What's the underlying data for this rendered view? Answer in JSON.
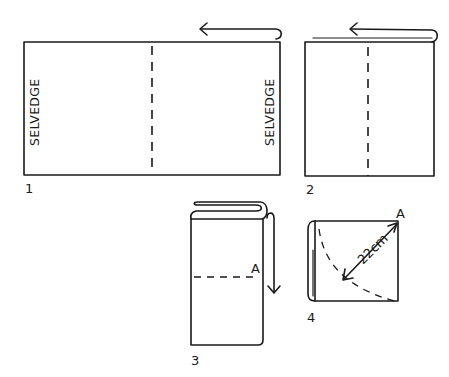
{
  "figure": {
    "type": "fabric folding instructions",
    "steps": [
      {
        "number": "1",
        "left_edge_label": "SELVEDGE",
        "right_edge_label": "SELVEDGE"
      },
      {
        "number": "2"
      },
      {
        "number": "3",
        "point_label": "A"
      },
      {
        "number": "4",
        "point_label": "A",
        "measurement": "22cm"
      }
    ]
  },
  "colors": {
    "ink": "#1a1a1a",
    "background": "#ffffff"
  }
}
